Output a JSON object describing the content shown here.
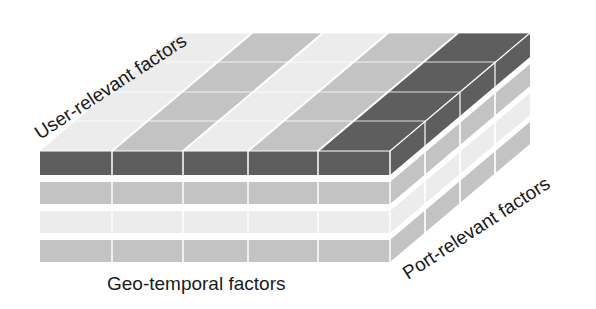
{
  "diagram": {
    "type": "isometric-tensor-block",
    "labels": {
      "user_axis": "User-relevant factors",
      "geo_axis": "Geo-temporal factors",
      "port_axis": "Port-relevant factors"
    },
    "colors": {
      "dark": "#5e5e5e",
      "medium": "#c3c3c3",
      "light": "#ececec",
      "divider": "#ffffff"
    },
    "front_rows": [
      "dark",
      "medium",
      "light",
      "medium"
    ],
    "front_columns": 5,
    "top_stripes": [
      "light",
      "medium",
      "light",
      "medium",
      "dark"
    ],
    "side_columns": 4
  }
}
